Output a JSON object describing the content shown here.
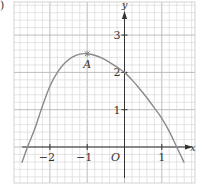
{
  "figure_fragment": ")",
  "chart_data": {
    "type": "line",
    "title": "",
    "xlabel": "x",
    "ylabel": "y",
    "origin_label": "O",
    "x_ticks": [
      -2,
      -1,
      1
    ],
    "x_tick_labels": [
      "−2",
      "−1",
      "1"
    ],
    "y_ticks": [
      1,
      2,
      3
    ],
    "y_tick_labels": [
      "1",
      "2",
      "3"
    ],
    "xlim": [
      -3.0,
      1.9
    ],
    "ylim": [
      -1.0,
      3.9
    ],
    "grid": true,
    "grid_minor_step": 0.2,
    "series": [
      {
        "name": "curve",
        "x": [
          -2.75,
          -2.6,
          -2.4,
          -2.2,
          -2.0,
          -1.8,
          -1.6,
          -1.4,
          -1.2,
          -1.0,
          -0.8,
          -0.6,
          -0.4,
          -0.2,
          0.0,
          0.2,
          0.4,
          0.6,
          0.8,
          1.0,
          1.2,
          1.4,
          1.6
        ],
        "y": [
          -0.42,
          0.0,
          0.5,
          1.1,
          1.63,
          2.0,
          2.25,
          2.41,
          2.49,
          2.5,
          2.46,
          2.38,
          2.27,
          2.14,
          2.0,
          1.8,
          1.57,
          1.32,
          1.05,
          0.77,
          0.42,
          0.0,
          -0.42
        ]
      }
    ],
    "annotations": [
      {
        "label": "A",
        "x": -1,
        "y": 2.5,
        "marker": "cross"
      }
    ]
  }
}
